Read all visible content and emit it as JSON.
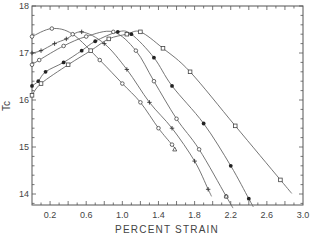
{
  "chart_data": {
    "type": "line",
    "title": "",
    "xlabel": "PERCENT STRAIN",
    "ylabel": "Tc",
    "xlim": [
      0.0,
      3.0
    ],
    "ylim": [
      13.8,
      18.0
    ],
    "x_ticks": [
      "0.2",
      "0.6",
      "1.0",
      "1.4",
      "1.8",
      "2.2",
      "2.6",
      "3.0"
    ],
    "y_ticks": [
      "14",
      "15",
      "16",
      "17",
      "18"
    ],
    "grid": false,
    "legend": "none",
    "series": [
      {
        "name": "open-circle-1",
        "marker": "open-circle",
        "points": [
          [
            0.0,
            17.35
          ],
          [
            0.22,
            17.52
          ],
          [
            0.45,
            17.4
          ],
          [
            0.75,
            16.85
          ],
          [
            1.0,
            16.35
          ],
          [
            1.2,
            15.95
          ],
          [
            1.4,
            15.4
          ],
          [
            1.55,
            15.05
          ]
        ]
      },
      {
        "name": "plus",
        "marker": "plus",
        "points": [
          [
            0.0,
            17.0
          ],
          [
            0.1,
            17.05
          ],
          [
            0.25,
            17.2
          ],
          [
            0.38,
            17.3
          ],
          [
            0.55,
            17.45
          ],
          [
            0.8,
            17.2
          ],
          [
            1.05,
            16.65
          ],
          [
            1.3,
            15.95
          ],
          [
            1.55,
            15.4
          ],
          [
            1.8,
            14.7
          ],
          [
            1.95,
            14.1
          ]
        ]
      },
      {
        "name": "open-circle-2",
        "marker": "open-circle",
        "points": [
          [
            0.0,
            16.75
          ],
          [
            0.08,
            16.85
          ],
          [
            0.35,
            17.15
          ],
          [
            0.6,
            17.35
          ],
          [
            0.9,
            17.45
          ],
          [
            1.15,
            17.05
          ],
          [
            1.35,
            16.4
          ],
          [
            1.6,
            15.6
          ],
          [
            1.85,
            14.95
          ],
          [
            2.15,
            13.95
          ]
        ]
      },
      {
        "name": "filled-circle",
        "marker": "filled-circle",
        "points": [
          [
            0.0,
            16.3
          ],
          [
            0.07,
            16.4
          ],
          [
            0.15,
            16.6
          ],
          [
            0.35,
            16.8
          ],
          [
            0.55,
            17.05
          ],
          [
            0.7,
            17.25
          ],
          [
            0.95,
            17.45
          ],
          [
            1.1,
            17.4
          ],
          [
            1.35,
            16.9
          ],
          [
            1.55,
            16.3
          ],
          [
            1.9,
            15.5
          ],
          [
            2.2,
            14.6
          ],
          [
            2.4,
            13.9
          ]
        ]
      },
      {
        "name": "open-square",
        "marker": "open-square",
        "points": [
          [
            0.0,
            16.1
          ],
          [
            0.1,
            16.35
          ],
          [
            0.4,
            16.75
          ],
          [
            0.65,
            17.05
          ],
          [
            0.85,
            17.3
          ],
          [
            1.05,
            17.4
          ],
          [
            1.2,
            17.45
          ],
          [
            1.45,
            17.1
          ],
          [
            1.75,
            16.6
          ],
          [
            2.25,
            15.45
          ],
          [
            2.75,
            14.3
          ]
        ]
      },
      {
        "name": "open-triangle",
        "marker": "open-triangle",
        "points": [
          [
            1.58,
            14.95
          ],
          [
            2.15,
            13.95
          ]
        ]
      }
    ]
  }
}
